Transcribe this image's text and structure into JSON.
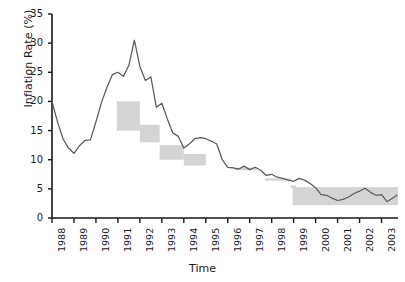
{
  "chart_data": {
    "type": "line",
    "title": "",
    "xlabel": "Time",
    "ylabel": "Inflation Rate (%)",
    "ylim": [
      0,
      35
    ],
    "yticks": [
      0,
      5,
      10,
      15,
      20,
      25,
      30,
      35
    ],
    "xlim": [
      1988,
      2003.75
    ],
    "xticks": [
      1988,
      1989,
      1990,
      1991,
      1992,
      1993,
      1994,
      1995,
      1996,
      1997,
      1998,
      1999,
      2000,
      2001,
      2002,
      2003
    ],
    "xticklabels": [
      "1988",
      "1989",
      "1990",
      "1991",
      "1992",
      "1993",
      "1994",
      "1995",
      "1996",
      "1997",
      "1998",
      "1999",
      "2000",
      "2001",
      "2002",
      "2003"
    ],
    "grid": false,
    "legend": null,
    "series": [
      {
        "name": "Inflation Rate",
        "color": "#5a5a5a",
        "x": [
          1988.0,
          1988.25,
          1988.5,
          1988.75,
          1989.0,
          1989.25,
          1989.5,
          1989.75,
          1990.0,
          1990.25,
          1990.5,
          1990.75,
          1991.0,
          1991.25,
          1991.5,
          1991.75,
          1992.0,
          1992.25,
          1992.5,
          1992.75,
          1993.0,
          1993.25,
          1993.5,
          1993.75,
          1994.0,
          1994.25,
          1994.5,
          1994.75,
          1995.0,
          1995.25,
          1995.5,
          1995.75,
          1996.0,
          1996.25,
          1996.5,
          1996.75,
          1997.0,
          1997.25,
          1997.5,
          1997.75,
          1998.0,
          1998.25,
          1998.5,
          1998.75,
          1999.0,
          1999.25,
          1999.5,
          1999.75,
          2000.0,
          2000.25,
          2000.5,
          2000.75,
          2001.0,
          2001.25,
          2001.5,
          2001.75,
          2002.0,
          2002.25,
          2002.5,
          2002.75,
          2003.0,
          2003.25,
          2003.5,
          2003.7
        ],
        "values": [
          20.0,
          16.5,
          13.6,
          12.0,
          11.1,
          12.4,
          13.3,
          13.4,
          16.5,
          19.8,
          22.4,
          24.6,
          25.0,
          24.3,
          26.2,
          30.5,
          26.0,
          23.6,
          24.2,
          19.0,
          19.7,
          17.0,
          14.6,
          14.0,
          12.0,
          12.7,
          13.6,
          13.8,
          13.6,
          13.2,
          12.7,
          10.0,
          8.7,
          8.6,
          8.4,
          8.9,
          8.3,
          8.7,
          8.2,
          7.3,
          7.5,
          7.0,
          6.8,
          6.5,
          6.3,
          6.8,
          6.5,
          5.9,
          5.2,
          4.0,
          3.9,
          3.4,
          3.0,
          3.2,
          3.6,
          4.2,
          4.6,
          5.1,
          4.4,
          3.9,
          4.0,
          2.8,
          3.4,
          3.9
        ]
      }
    ],
    "target_bands": [
      {
        "name": "target-box-1991",
        "x_start": 1990.95,
        "x_end": 1992.0,
        "y_low": 15.0,
        "y_high": 20.0
      },
      {
        "name": "target-box-1992",
        "x_start": 1992.0,
        "x_end": 1992.9,
        "y_low": 13.0,
        "y_high": 16.0
      },
      {
        "name": "target-box-1993",
        "x_start": 1992.9,
        "x_end": 1994.0,
        "y_low": 10.0,
        "y_high": 12.5
      },
      {
        "name": "target-box-1994",
        "x_start": 1994.0,
        "x_end": 1995.0,
        "y_low": 9.0,
        "y_high": 11.0
      },
      {
        "name": "target-line-1996",
        "x_start": 1996.3,
        "x_end": 1997.3,
        "y_low": 8.2,
        "y_high": 8.6
      },
      {
        "name": "target-line-1998",
        "x_start": 1997.7,
        "x_end": 1998.9,
        "y_low": 6.4,
        "y_high": 6.8
      },
      {
        "name": "target-line-1999",
        "x_start": 1998.85,
        "x_end": 1999.1,
        "y_low": 5.2,
        "y_high": 5.6
      },
      {
        "name": "target-band-2000-2003",
        "x_start": 1998.95,
        "x_end": 2003.75,
        "y_low": 2.2,
        "y_high": 5.3
      }
    ],
    "colors": {
      "line": "#5a5a5a",
      "band": "#d4d4d4",
      "axis": "#1a1a1a",
      "text": "#1a1a1a",
      "background": "#ffffff"
    }
  }
}
